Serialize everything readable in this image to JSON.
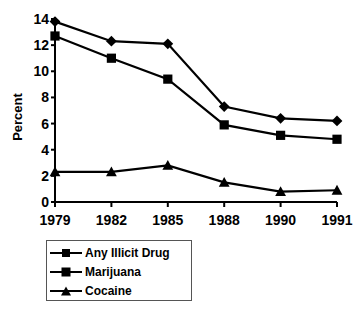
{
  "chart_data": {
    "type": "line",
    "title": "",
    "xlabel": "",
    "ylabel": "Percent",
    "categories": [
      "1979",
      "1982",
      "1985",
      "1988",
      "1990",
      "1991"
    ],
    "yticks": [
      "0",
      "2",
      "4",
      "6",
      "8",
      "10",
      "12",
      "14"
    ],
    "ylim": [
      0,
      14
    ],
    "grid": false,
    "legend_position": "below-left",
    "series": [
      {
        "name": "Any Illicit Drug",
        "marker": "diamond",
        "color": "#000000",
        "values": [
          13.8,
          12.3,
          12.1,
          7.3,
          6.4,
          6.2
        ]
      },
      {
        "name": "Marijuana",
        "marker": "square",
        "color": "#000000",
        "values": [
          12.7,
          11.0,
          9.4,
          5.9,
          5.1,
          4.8
        ]
      },
      {
        "name": "Cocaine",
        "marker": "triangle",
        "color": "#000000",
        "values": [
          2.3,
          2.3,
          2.8,
          1.5,
          0.8,
          0.9
        ]
      }
    ]
  },
  "legend": {
    "items": [
      {
        "label": "Any Illicit Drug"
      },
      {
        "label": "Marijuana"
      },
      {
        "label": "Cocaine"
      }
    ]
  },
  "axis": {
    "y_title": "Percent"
  }
}
